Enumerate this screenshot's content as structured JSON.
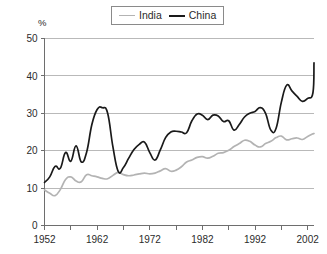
{
  "chart_data": {
    "type": "line",
    "title": "",
    "subtitle": "",
    "xlabel": "",
    "ylabel": "%",
    "ylim": [
      0,
      50
    ],
    "xlim": [
      1952,
      2003
    ],
    "yticks": [
      0,
      10,
      20,
      30,
      40,
      50
    ],
    "xticks": [
      1952,
      1962,
      1972,
      1982,
      1992,
      2002
    ],
    "xtick_labels": [
      "1952",
      "1962",
      "1972",
      "1982",
      "1992",
      "2002"
    ],
    "ytick_labels": [
      "0",
      "10",
      "20",
      "30",
      "40",
      "50"
    ],
    "xtick_minor_step": 5,
    "grid": "horizontal",
    "legend_position": "top-center",
    "legend_boxed": true,
    "x": [
      1952,
      1953,
      1954,
      1955,
      1956,
      1957,
      1958,
      1959,
      1960,
      1961,
      1962,
      1963,
      1964,
      1965,
      1966,
      1967,
      1968,
      1969,
      1970,
      1971,
      1972,
      1973,
      1974,
      1975,
      1976,
      1977,
      1978,
      1979,
      1980,
      1981,
      1982,
      1983,
      1984,
      1985,
      1986,
      1987,
      1988,
      1989,
      1990,
      1991,
      1992,
      1993,
      1994,
      1995,
      1996,
      1997,
      1998,
      1999,
      2000,
      2001,
      2002,
      2003
    ],
    "series": [
      {
        "name": "India",
        "color": "#b3b3b3",
        "values": [
          9.5,
          8.6,
          8.0,
          9.6,
          12.3,
          13.0,
          11.9,
          11.7,
          13.6,
          13.3,
          13.0,
          12.6,
          12.5,
          13.4,
          14.2,
          13.6,
          13.3,
          13.5,
          13.8,
          14.0,
          13.8,
          14.0,
          14.6,
          15.2,
          14.5,
          14.8,
          15.7,
          17.0,
          17.5,
          18.2,
          18.4,
          18.0,
          18.5,
          19.3,
          19.5,
          20.1,
          21.1,
          21.9,
          22.8,
          22.5,
          21.5,
          21.0,
          21.9,
          22.5,
          23.5,
          23.9,
          22.9,
          23.2,
          23.4,
          23.0,
          23.8,
          24.5
        ]
      },
      {
        "name": "China",
        "color": "#1a1a1a",
        "values": [
          11.5,
          13.0,
          15.8,
          15.3,
          19.5,
          17.2,
          21.3,
          17.0,
          19.6,
          27.0,
          31.0,
          31.5,
          30.0,
          21.0,
          14.5,
          15.5,
          18.0,
          20.3,
          21.7,
          22.3,
          19.5,
          17.5,
          20.2,
          23.5,
          25.0,
          25.2,
          25.0,
          24.8,
          28.0,
          29.8,
          29.5,
          28.3,
          29.5,
          29.3,
          27.8,
          28.0,
          25.5,
          27.0,
          29.0,
          30.0,
          30.5,
          31.5,
          30.0,
          25.5,
          26.0,
          33.0,
          37.5,
          36.0,
          34.5,
          33.2,
          34.0,
          35.5
        ]
      }
    ],
    "series_tail_x": [
      2003.2
    ],
    "series_tail": [
      {
        "name": "India",
        "values": [
          24.6
        ]
      },
      {
        "name": "China",
        "values": [
          43.5
        ]
      }
    ],
    "annotations": []
  },
  "legend": {
    "entries": [
      {
        "label": "India",
        "swatch": "line-swatch-light"
      },
      {
        "label": "China",
        "swatch": "line-swatch-dark"
      }
    ]
  },
  "axes": {
    "y_unit": "%"
  }
}
